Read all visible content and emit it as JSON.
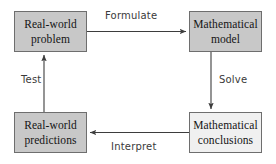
{
  "diagram": {
    "background_color": "#ffffff",
    "node_fill": "#c8c8c8",
    "node_fill_light": "#f0f0f0",
    "node_border_color": "#6e6e6e",
    "edge_color": "#4a4a4a",
    "nodes": [
      {
        "id": "real-world-problem",
        "line1": "Real-world",
        "line2": "problem",
        "fill": "#c8c8c8"
      },
      {
        "id": "mathematical-model",
        "line1": "Mathematical",
        "line2": "model",
        "fill": "#c8c8c8"
      },
      {
        "id": "real-world-predictions",
        "line1": "Real-world",
        "line2": "predictions",
        "fill": "#c8c8c8"
      },
      {
        "id": "mathematical-conclusions",
        "line1": "Mathematical",
        "line2": "conclusions",
        "fill": "#f0f0f0"
      }
    ],
    "edges": [
      {
        "id": "formulate",
        "label": "Formulate",
        "from": "real-world-problem",
        "to": "mathematical-model",
        "direction": "right"
      },
      {
        "id": "solve",
        "label": "Solve",
        "from": "mathematical-model",
        "to": "mathematical-conclusions",
        "direction": "down"
      },
      {
        "id": "interpret",
        "label": "Interpret",
        "from": "mathematical-conclusions",
        "to": "real-world-predictions",
        "direction": "left"
      },
      {
        "id": "test",
        "label": "Test",
        "from": "real-world-predictions",
        "to": "real-world-problem",
        "direction": "up"
      }
    ]
  }
}
